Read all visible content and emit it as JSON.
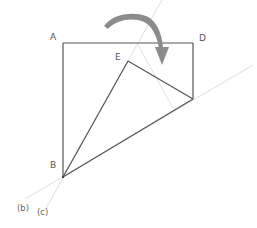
{
  "diagram": {
    "colors": {
      "main_line": "#555555",
      "guide_line": "#dddddd",
      "arrow": "#8c8c8c",
      "label": "#555555"
    },
    "points": {
      "A": {
        "label": "A",
        "x": 63,
        "y": 43
      },
      "D": {
        "label": "D",
        "x": 193,
        "y": 43
      },
      "E": {
        "label": "E",
        "x": 128,
        "y": 61
      },
      "F": {
        "label": "",
        "x": 193,
        "y": 99
      },
      "B": {
        "label": "B",
        "x": 63,
        "y": 177
      }
    },
    "labels": {
      "A": "A",
      "D": "D",
      "E": "E",
      "B": "B",
      "line_b": "(b)",
      "line_c": "(c)"
    },
    "guide_lines": [
      {
        "name": "line-b",
        "label": "(b)",
        "from": [
          25,
          199
        ],
        "to": [
          253,
          65
        ]
      },
      {
        "name": "line-c",
        "label": "(c)",
        "from": [
          45,
          210
        ],
        "to": [
          162,
          0
        ]
      },
      {
        "name": "crease-line",
        "label": "",
        "from": [
          137,
          43
        ],
        "to": [
          173,
          108
        ]
      }
    ],
    "arrow": {
      "description": "curved fold arrow indicating corner folding over",
      "direction": "clockwise"
    }
  }
}
